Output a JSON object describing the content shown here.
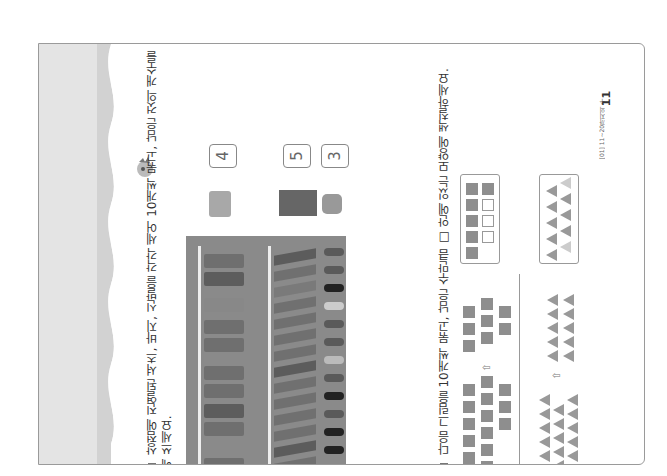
{
  "page": {
    "number": "11",
    "footer_label": "[01] 11~20까지의 수",
    "orientation": "rotated-90"
  },
  "problem1": {
    "bullet_icon": "square-bullet-icon",
    "instruction_line1": "상점에 진열된 셔츠, 바지, 신발을 각각 세어 10개씩 묶고, 남은 것의 개수를 □ 안",
    "instruction_line2": "에 쓰세요.",
    "photo_description": "clothing store racks with shirts, pants and shoes",
    "answers": [
      {
        "item": "shirt",
        "value": "4"
      },
      {
        "item": "pants",
        "value": "5"
      },
      {
        "item": "shoes",
        "value": "3"
      }
    ]
  },
  "problem2": {
    "bullet_icon": "square-bullet-icon",
    "instruction": "다음 그림을 10개씩 묶고, 남은 수만큼 □ 안에 있는 모양에 색칠하세요.",
    "arrow_symbol": "⇧",
    "squares": {
      "given_count": 14,
      "answer_filled": 6,
      "answer_empty": 3,
      "answer_boxes": 10
    },
    "triangles": {
      "given_count": 18,
      "answer_filled": 8,
      "answer_empty": 2,
      "answer_boxes": 10
    }
  },
  "colors": {
    "shape_fill": "#8e8e8e",
    "border": "#9a9a9a",
    "band": "#e4e4e4"
  }
}
